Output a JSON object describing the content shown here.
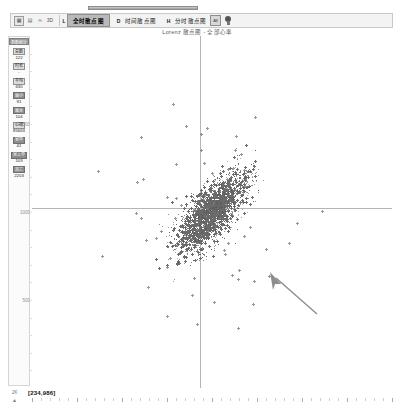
{
  "window": {
    "title": "Lorenz 散点图 - 全部心率"
  },
  "toolbar": {
    "icons": [
      {
        "name": "grid-icon",
        "glyph": "▦"
      },
      {
        "name": "chart-icon",
        "glyph": "▤"
      },
      {
        "name": "link-icon",
        "glyph": "∞"
      },
      {
        "name": "scale-icon",
        "glyph": "3D"
      }
    ],
    "items": [
      {
        "key": "L",
        "label": "全时散点图",
        "selected": true
      },
      {
        "key": "D",
        "label": "时间散点图",
        "selected": false
      },
      {
        "key": "H",
        "label": "分时散点图",
        "selected": false
      }
    ],
    "buttons": [
      {
        "name": "all-button",
        "label": "All"
      },
      {
        "name": "bulb-icon",
        "label": ""
      }
    ]
  },
  "sidebar": {
    "header": "参数统计",
    "items": [
      {
        "label": "总数",
        "value": "122"
      },
      {
        "label": "时长",
        "value": "-"
      },
      {
        "label": "平均",
        "value": "630"
      },
      {
        "label": "最小",
        "value": "91"
      },
      {
        "label": "最大",
        "value": "104"
      },
      {
        "label": "心搏",
        "value": "85663"
      },
      {
        "label": "室早",
        "value": "41"
      },
      {
        "label": "室上早",
        "value": "103"
      },
      {
        "label": "其它",
        "value": "2203"
      }
    ]
  },
  "chart_data": {
    "type": "scatter",
    "title": "Lorenz 散点图 - 全部心率",
    "xlabel": "",
    "ylabel": "",
    "xlim": [
      0,
      2000
    ],
    "ylim": [
      0,
      2000
    ],
    "xticks": [
      500,
      1000,
      1500
    ],
    "yticks": [
      1500,
      1000,
      500
    ],
    "grid": false,
    "legend_position": "none",
    "marker": "cross",
    "marker_color": "#6b6b6b",
    "point_count": 2400,
    "cluster": {
      "center_x": 1000,
      "center_y": 1000,
      "spread_x": 95,
      "spread_y": 110,
      "correlation": 0.72
    },
    "annotation": {
      "name": "mouse-cursor",
      "x": 1210,
      "y": 760,
      "direction": "up-left"
    }
  },
  "statusbar": {
    "corner_label": "2K",
    "corner_icon": "▲",
    "coordinates": "[234,986]"
  }
}
